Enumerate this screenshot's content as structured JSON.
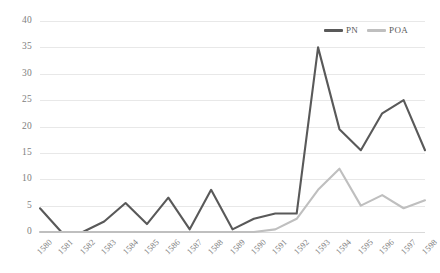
{
  "chart_data": {
    "type": "line",
    "title": "",
    "xlabel": "",
    "ylabel": "",
    "categories": [
      "1580",
      "1581",
      "1582",
      "1583",
      "1584",
      "1585",
      "1586",
      "1587",
      "1588",
      "1589",
      "1590",
      "1591",
      "1592",
      "1593",
      "1594",
      "1595",
      "1596",
      "1597",
      "1598"
    ],
    "series": [
      {
        "name": "PN",
        "color": "#595959",
        "values": [
          4.5,
          0,
          0,
          2,
          5.5,
          1.5,
          6.5,
          0.5,
          8,
          0.5,
          2.5,
          3.5,
          3.5,
          35,
          19.5,
          15.5,
          22.5,
          25,
          15.5
        ]
      },
      {
        "name": "POA",
        "color": "#bfbfbf",
        "values": [
          0,
          0,
          0,
          0,
          0,
          0,
          0,
          0,
          0,
          0,
          0,
          0.5,
          2.5,
          8,
          12,
          5,
          7,
          4.5,
          6
        ]
      }
    ],
    "ylim": [
      0,
      40
    ],
    "ytick_values": [
      0,
      5,
      10,
      15,
      20,
      25,
      30,
      35,
      40
    ],
    "ytick_labels": [
      "0",
      "5",
      "10",
      "15",
      "20",
      "25",
      "30",
      "35",
      "40"
    ],
    "grid": true,
    "grid_color": "#e8e8e8",
    "legend_position": "top-right",
    "background": "#ffffff",
    "axis_label_color": "#808080"
  }
}
